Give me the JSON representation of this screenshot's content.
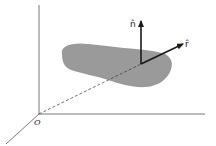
{
  "figure": {
    "labels": {
      "origin": "O",
      "normal_vector": "n̂",
      "radial_vector": "r̂"
    },
    "colors": {
      "surface": "#9a9a9a",
      "axes": "#555555",
      "vectors": "#1a1a1a",
      "background": "#ffffff"
    }
  }
}
